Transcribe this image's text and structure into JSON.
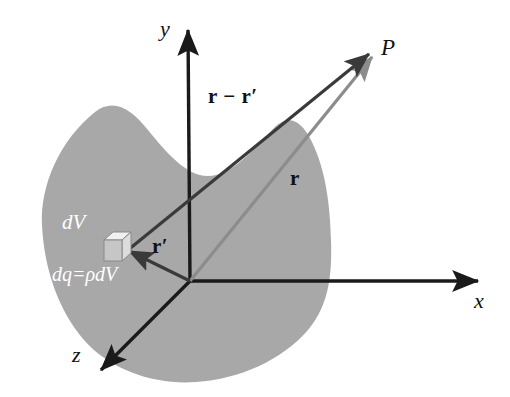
{
  "figure": {
    "background_color": "#ffffff",
    "blob_fill_color": "#a8a8a8",
    "axis_color": "#1a1a1a",
    "r_vector_color": "#8c8c8c",
    "separation_vector_color": "#3a3a3a",
    "cube_face_color": "#cfcfcf"
  },
  "axes": [
    {
      "name": "y-axis",
      "label": "y",
      "label_x": 160,
      "label_y": 18
    },
    {
      "name": "x-axis",
      "label": "x",
      "label_x": 474,
      "label_y": 290
    },
    {
      "name": "z-axis",
      "label": "z",
      "label_x": 72,
      "label_y": 344
    }
  ],
  "points": [
    {
      "name": "field-point",
      "label": "P",
      "label_x": 381,
      "label_y": 36
    },
    {
      "name": "origin",
      "label": "O",
      "x": 190,
      "y": 281
    }
  ],
  "vectors": [
    {
      "name": "separation-vector",
      "label": "r − r′",
      "label_x": 208,
      "label_y": 86,
      "color": "#3a3a3a",
      "from": "dV",
      "to": "P"
    },
    {
      "name": "position-vector-r",
      "label": "r",
      "label_x": 290,
      "label_y": 168,
      "color": "#8c8c8c",
      "from": "origin",
      "to": "P"
    },
    {
      "name": "source-vector-r-prime",
      "label": "r′",
      "label_x": 152,
      "label_y": 236,
      "color": "#3a3a3a",
      "from": "origin",
      "to": "dV"
    }
  ],
  "annotations": [
    {
      "name": "volume-element-label",
      "text": "dV",
      "x": 62,
      "y": 212,
      "color": "#ffffff"
    },
    {
      "name": "charge-element-label",
      "text": "dq=ρdV",
      "x": 52,
      "y": 264,
      "color": "#ffffff"
    }
  ],
  "shapes": {
    "charge_blob": {
      "name": "charge-distribution-blob",
      "fill": "#a8a8a8"
    },
    "volume_element_cube": {
      "name": "volume-element-cube",
      "x": 104,
      "y": 232,
      "size": 24
    }
  }
}
